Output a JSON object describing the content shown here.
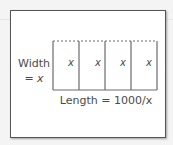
{
  "diagram": {
    "width_label": "Width",
    "width_value": "= x",
    "length_label": "Length = 1000/x",
    "cells": [
      "x",
      "x",
      "x",
      "x"
    ],
    "colors": {
      "line": "#6b6b6b",
      "text": "#4a4a4a",
      "frame": "#555555"
    }
  }
}
